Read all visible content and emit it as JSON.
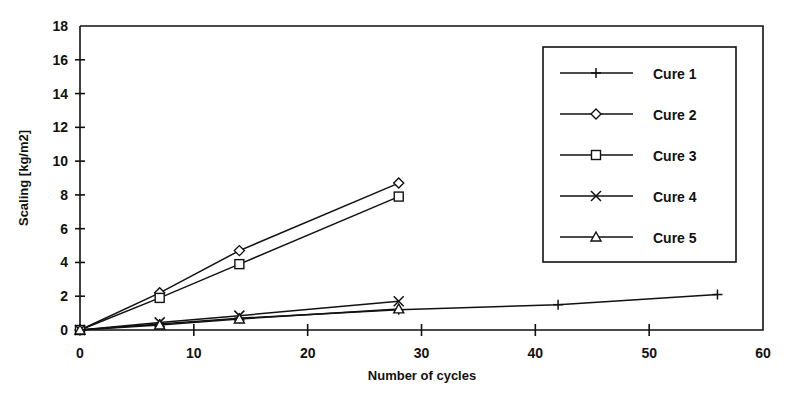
{
  "chart_data": {
    "type": "line",
    "title": "",
    "xlabel": "Number of cycles",
    "ylabel": "Scaling [kg/m2]",
    "xlim": [
      0,
      60
    ],
    "ylim": [
      0,
      18
    ],
    "xticks": [
      0,
      10,
      20,
      30,
      40,
      50,
      60
    ],
    "yticks": [
      0,
      2,
      4,
      6,
      8,
      10,
      12,
      14,
      16,
      18
    ],
    "grid": false,
    "legend_position": "upper right",
    "series": [
      {
        "name": "Cure 1",
        "marker": "plus-marker",
        "x": [
          0,
          7,
          14,
          28,
          42,
          56
        ],
        "y": [
          0,
          0.35,
          0.7,
          1.2,
          1.5,
          2.1
        ]
      },
      {
        "name": "Cure 2",
        "marker": "diamond-marker",
        "x": [
          0,
          7,
          14,
          28
        ],
        "y": [
          0,
          2.2,
          4.7,
          8.7
        ]
      },
      {
        "name": "Cure 3",
        "marker": "square-marker",
        "x": [
          0,
          7,
          14,
          28
        ],
        "y": [
          0,
          1.9,
          3.9,
          7.9
        ]
      },
      {
        "name": "Cure 4",
        "marker": "x-marker",
        "x": [
          0,
          7,
          14,
          28
        ],
        "y": [
          0,
          0.45,
          0.85,
          1.7
        ]
      },
      {
        "name": "Cure 5",
        "marker": "triangle-marker",
        "x": [
          0,
          7,
          14,
          28
        ],
        "y": [
          0,
          0.3,
          0.65,
          1.25
        ]
      }
    ]
  },
  "legend": {
    "entries": [
      {
        "label": "Cure 1",
        "marker": "plus-marker"
      },
      {
        "label": "Cure 2",
        "marker": "diamond-marker"
      },
      {
        "label": "Cure 3",
        "marker": "square-marker"
      },
      {
        "label": "Cure 4",
        "marker": "x-marker"
      },
      {
        "label": "Cure 5",
        "marker": "triangle-marker"
      }
    ]
  },
  "colors": {
    "ink": "#111111",
    "background": "#ffffff"
  }
}
